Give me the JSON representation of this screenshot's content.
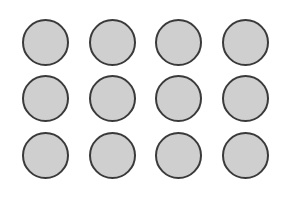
{
  "grid": {
    "rows": 3,
    "columns": 4,
    "circle_fill": "#cfcfcf",
    "circle_stroke": "#3a3a3a",
    "items": [
      {
        "row": 0,
        "col": 0
      },
      {
        "row": 0,
        "col": 1
      },
      {
        "row": 0,
        "col": 2
      },
      {
        "row": 0,
        "col": 3
      },
      {
        "row": 1,
        "col": 0
      },
      {
        "row": 1,
        "col": 1
      },
      {
        "row": 1,
        "col": 2
      },
      {
        "row": 1,
        "col": 3
      },
      {
        "row": 2,
        "col": 0
      },
      {
        "row": 2,
        "col": 1
      },
      {
        "row": 2,
        "col": 2
      },
      {
        "row": 2,
        "col": 3
      }
    ]
  }
}
